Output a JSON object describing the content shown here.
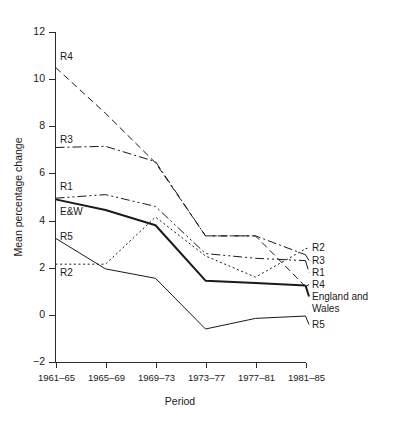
{
  "figure": {
    "partial_top_text": "",
    "background": "#ffffff",
    "ink_color": "#1a1a1a"
  },
  "chart_data": {
    "type": "line",
    "title": "",
    "xlabel": "Period",
    "ylabel": "Mean percentage change",
    "categories": [
      "1961–65",
      "1965–69",
      "1969–73",
      "1973–77",
      "1977–81",
      "1981–85"
    ],
    "ylim": [
      -2,
      12
    ],
    "yticks": [
      -2,
      0,
      2,
      4,
      6,
      8,
      10,
      12
    ],
    "ytick_labels": [
      "−2",
      "0",
      "2",
      "4",
      "6",
      "8",
      "10",
      "12"
    ],
    "grid": false,
    "legend_position": "inline-endpoints",
    "series": [
      {
        "name": "R4",
        "label_left": "R4",
        "label_right": "R4",
        "style": "dashed",
        "width": 1,
        "values": [
          10.5,
          8.55,
          6.45,
          3.35,
          3.35,
          1.2
        ]
      },
      {
        "name": "R3",
        "label_left": "R3",
        "label_right": "R3",
        "style": "dash-dot",
        "width": 1,
        "values": [
          7.1,
          7.15,
          6.5,
          3.35,
          3.35,
          2.55
        ]
      },
      {
        "name": "R1",
        "label_left": "R1",
        "label_right": "R1",
        "style": "dash-dot-dot",
        "width": 1,
        "values": [
          4.95,
          5.1,
          4.6,
          2.6,
          2.4,
          2.3
        ]
      },
      {
        "name": "England and Wales",
        "label_left": "E&W",
        "label_right": "England and Wales",
        "label_right_line1": "England and",
        "label_right_line2": "Wales",
        "style": "solid-thick",
        "width": 2,
        "values": [
          4.9,
          4.45,
          3.8,
          1.45,
          1.35,
          1.25
        ]
      },
      {
        "name": "R5",
        "label_left": "R5",
        "label_right": "R5",
        "style": "solid-thin",
        "width": 1,
        "values": [
          3.25,
          1.95,
          1.55,
          -0.6,
          -0.15,
          -0.05
        ]
      },
      {
        "name": "R2",
        "label_left": "R2",
        "label_right": "R2",
        "style": "dotted",
        "width": 1,
        "values": [
          2.15,
          2.15,
          4.15,
          2.5,
          1.6,
          2.8
        ]
      }
    ]
  }
}
